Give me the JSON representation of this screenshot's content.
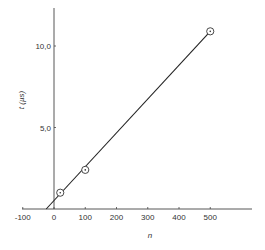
{
  "chart_data": {
    "type": "scatter",
    "title": "",
    "xlabel": "n",
    "ylabel": "t (µs)",
    "xlim": [
      -100,
      620
    ],
    "ylim": [
      0,
      12.5
    ],
    "x_ticks": [
      -100,
      0,
      100,
      200,
      300,
      400,
      500
    ],
    "x_tick_labels": [
      "-100",
      "0",
      "100",
      "200",
      "300",
      "400",
      "500"
    ],
    "y_ticks": [
      5.0,
      10.0
    ],
    "y_tick_labels": [
      "5,0",
      "10,0"
    ],
    "grid": false,
    "legend": null,
    "series": [
      {
        "name": "measured",
        "marker": "circle-dot",
        "x": [
          20,
          100,
          500
        ],
        "y": [
          1.0,
          2.4,
          10.9
        ]
      },
      {
        "name": "linear fit",
        "type": "line",
        "x": [
          -25,
          500
        ],
        "y": [
          0.0,
          10.9
        ]
      }
    ]
  }
}
